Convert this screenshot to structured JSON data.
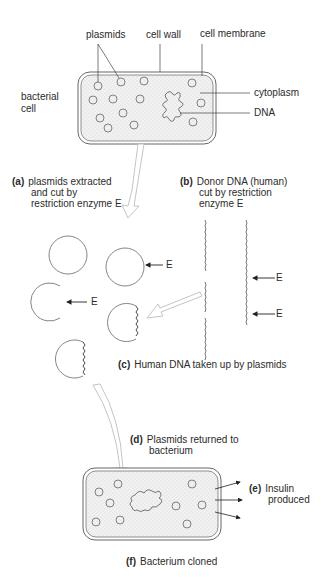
{
  "labels": {
    "plasmids": "plasmids",
    "cell_wall": "cell wall",
    "cell_membrane": "cell membrane",
    "bacterial_cell_line1": "bacterial",
    "bacterial_cell_line2": "cell",
    "cytoplasm": "cytoplasm",
    "dna": "DNA",
    "enzyme": "E"
  },
  "steps": [
    {
      "letter": "(a)",
      "lines": [
        "plasmids extracted",
        "and cut by",
        "restriction enzyme E"
      ]
    },
    {
      "letter": "(b)",
      "lines": [
        "Donor DNA (human)",
        "cut by restriction",
        "enzyme E"
      ]
    },
    {
      "letter": "(c)",
      "lines": [
        "Human DNA taken up by plasmids"
      ]
    },
    {
      "letter": "(d)",
      "lines": [
        "Plasmids returned to",
        "bacterium"
      ]
    },
    {
      "letter": "(e)",
      "lines": [
        "Insulin",
        "produced"
      ]
    },
    {
      "letter": "(f)",
      "lines": [
        "Bacterium cloned"
      ]
    }
  ],
  "colors": {
    "cytoplasm_fill": "#ececec",
    "outline": "#555555",
    "arrow_outline": "#bdbdbd"
  }
}
